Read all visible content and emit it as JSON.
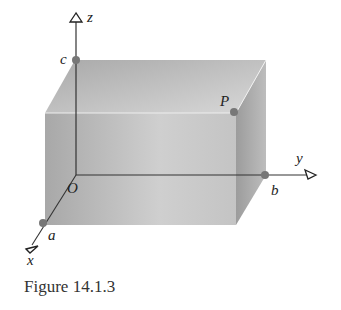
{
  "figure": {
    "caption": "Figure 14.1.3",
    "axes": {
      "x": "x",
      "y": "y",
      "z": "z"
    },
    "origin_label": "O",
    "points": {
      "a": "a",
      "b": "b",
      "c": "c",
      "P": "P"
    },
    "colors": {
      "front_face": "#b4b4b4",
      "top_face": "#c8c8c8",
      "side_face": "#9a9a9a",
      "point_fill": "#777777",
      "axis": "#333333"
    }
  }
}
